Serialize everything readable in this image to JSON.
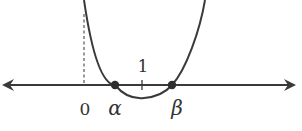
{
  "diagram": {
    "type": "parabola-roots-on-number-line",
    "colors": {
      "stroke": "#3a3a3a",
      "dashed": "#555555",
      "text": "#333333",
      "background": "#ffffff"
    },
    "axis": {
      "y": 85,
      "x_start": 2,
      "x_end": 296,
      "arrows": "both"
    },
    "dashed_line": {
      "x": 84,
      "y_top": 14,
      "y_bottom": 85
    },
    "tick": {
      "x": 142,
      "label": "1"
    },
    "points": [
      {
        "name": "alpha",
        "label": "α",
        "x": 115
      },
      {
        "name": "beta",
        "label": "β",
        "x": 172
      }
    ],
    "labels": {
      "origin": "0",
      "one": "1",
      "alpha": "α",
      "beta": "β"
    },
    "parabola": {
      "left_top_x": 84,
      "right_top_x": 205,
      "vertex_x": 144,
      "vertex_y": 98
    }
  }
}
